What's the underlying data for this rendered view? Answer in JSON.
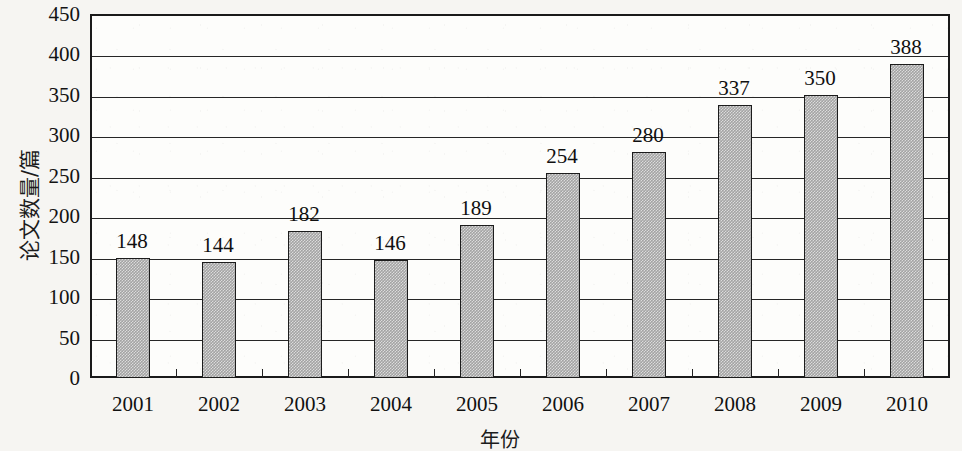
{
  "chart_data": {
    "type": "bar",
    "title": "",
    "subtitle": "",
    "xlabel": "年份",
    "ylabel": "论文数量/篇",
    "categories": [
      "2001",
      "2002",
      "2003",
      "2004",
      "2005",
      "2006",
      "2007",
      "2008",
      "2009",
      "2010"
    ],
    "values": [
      148,
      144,
      182,
      146,
      189,
      254,
      280,
      337,
      350,
      388
    ],
    "series": [
      {
        "name": "论文数量/篇",
        "values": [
          148,
          144,
          182,
          146,
          189,
          254,
          280,
          337,
          350,
          388
        ]
      }
    ],
    "data_labels": [
      "148",
      "144",
      "182",
      "146",
      "189",
      "254",
      "280",
      "337",
      "350",
      "388"
    ],
    "ylim": [
      0,
      450
    ],
    "ytick_step": 50,
    "yticks": [
      0,
      50,
      100,
      150,
      200,
      250,
      300,
      350,
      400,
      450
    ],
    "ytick_labels": [
      "0",
      "50",
      "100",
      "150",
      "200",
      "250",
      "300",
      "350",
      "400",
      "450"
    ],
    "xlim_categories": 10,
    "grid": true,
    "grid_axis": "y",
    "legend": false,
    "legend_position": "none",
    "bar_fill_color": "#a3a3a3",
    "bar_edge_color": "#1c1c1c",
    "grid_color": "#262626",
    "axis_color": "#1a1a1a",
    "text_color": "#111111",
    "plot_background_color": "#fdfdfb",
    "figure_background_color": "#f6f5f2"
  }
}
